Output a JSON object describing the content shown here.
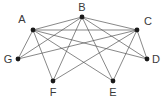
{
  "figure": {
    "kind": "undirected-graph-drawing",
    "width": 163,
    "height": 99,
    "background_color": "#ffffff",
    "edge_color": "#555555",
    "node_color": "#1a1a1a",
    "label_color": "#3a3a3a",
    "node_radius": 2.4,
    "edge_width": 0.7
  },
  "graph": {
    "node_ids": [
      "A",
      "B",
      "C",
      "D",
      "E",
      "F",
      "G"
    ],
    "nodes": [
      {
        "id": "A",
        "label": "A",
        "x": 33,
        "y": 30,
        "label_x": 22,
        "label_y": 19
      },
      {
        "id": "B",
        "label": "B",
        "x": 82,
        "y": 17,
        "label_x": 82,
        "label_y": 7
      },
      {
        "id": "C",
        "label": "C",
        "x": 137,
        "y": 30,
        "label_x": 148,
        "label_y": 21
      },
      {
        "id": "D",
        "label": "D",
        "x": 147,
        "y": 59,
        "label_x": 156,
        "label_y": 59
      },
      {
        "id": "E",
        "label": "E",
        "x": 113,
        "y": 81,
        "label_x": 113,
        "label_y": 92
      },
      {
        "id": "F",
        "label": "F",
        "x": 53,
        "y": 81,
        "label_x": 53,
        "label_y": 92
      },
      {
        "id": "G",
        "label": "G",
        "x": 18,
        "y": 59,
        "label_x": 8,
        "label_y": 59
      }
    ],
    "edges": [
      {
        "source": "A",
        "target": "B"
      },
      {
        "source": "A",
        "target": "C"
      },
      {
        "source": "A",
        "target": "D"
      },
      {
        "source": "A",
        "target": "E"
      },
      {
        "source": "A",
        "target": "F"
      },
      {
        "source": "A",
        "target": "G"
      },
      {
        "source": "B",
        "target": "C"
      },
      {
        "source": "B",
        "target": "D"
      },
      {
        "source": "B",
        "target": "E"
      },
      {
        "source": "B",
        "target": "F"
      },
      {
        "source": "B",
        "target": "G"
      },
      {
        "source": "C",
        "target": "D"
      },
      {
        "source": "C",
        "target": "E"
      },
      {
        "source": "C",
        "target": "F"
      },
      {
        "source": "C",
        "target": "G"
      }
    ],
    "edge_count": 15,
    "node_count": 7
  }
}
